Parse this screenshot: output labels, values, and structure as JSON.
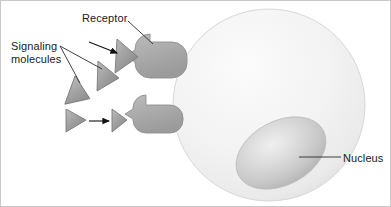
{
  "figure": {
    "background_color": "#ffffff",
    "border_color": "#c8c8c8",
    "width": 391,
    "height": 207
  },
  "labels": {
    "receptor": "Receptor",
    "signaling_line1": "Signaling",
    "signaling_line2": "molecules",
    "nucleus": "Nucleus"
  },
  "colors": {
    "cell_body": "#f2f2f2",
    "cell_body_edge": "#d8d8d8",
    "nucleus_light": "#e8e8e8",
    "nucleus_mid": "#cfcfcf",
    "nucleus_dark": "#b8b8b8",
    "receptor_fill": "#a8a8a8",
    "receptor_edge": "#8f8f8f",
    "molecule_fill": "#9e9e9e",
    "molecule_edge": "#7a7a7a",
    "leader_line": "#2b2b2b",
    "arrow": "#111111",
    "text": "#1a1a1a"
  },
  "elements": {
    "cell": {
      "name": "cell body",
      "shape": "circle"
    },
    "nucleus": {
      "name": "nucleus",
      "shape": "ellipse",
      "rotation_deg": -28
    },
    "receptors": [
      {
        "id": "receptor-upper",
        "shape": "rounded-rectangle-with-notch"
      },
      {
        "id": "receptor-lower",
        "shape": "rounded-rectangle-with-notch"
      }
    ],
    "signaling_molecules": [
      {
        "id": "molecule-bound-upper",
        "state": "bound",
        "shape": "triangle"
      },
      {
        "id": "molecule-free-mid",
        "state": "free",
        "shape": "triangle"
      },
      {
        "id": "molecule-free-lower-left",
        "state": "free",
        "shape": "triangle"
      },
      {
        "id": "molecule-free-bottom",
        "state": "free",
        "shape": "triangle"
      },
      {
        "id": "molecule-bound-lower",
        "state": "bound",
        "shape": "triangle"
      }
    ],
    "arrows": [
      {
        "id": "arrow-upper-binding",
        "direction": "down-right"
      },
      {
        "id": "arrow-lower-binding",
        "direction": "right"
      }
    ],
    "leader_lines": [
      {
        "id": "leader-receptor",
        "from": "receptor-label",
        "to": "receptor-upper"
      },
      {
        "id": "leader-signaling-a",
        "from": "signaling-label",
        "to": "molecule-free-bottom"
      },
      {
        "id": "leader-signaling-b",
        "from": "signaling-label",
        "to": "molecule-free-mid"
      },
      {
        "id": "leader-nucleus",
        "from": "nucleus-label",
        "to": "nucleus"
      }
    ]
  }
}
